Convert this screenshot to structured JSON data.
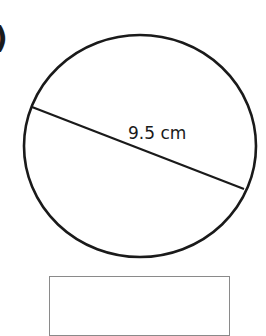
{
  "question": {
    "label_fragment": ")"
  },
  "figure": {
    "shape": "circle",
    "diameter_label": "9.5 cm",
    "stroke_color": "#1a1a1a"
  },
  "answer_box": {
    "value": ""
  }
}
